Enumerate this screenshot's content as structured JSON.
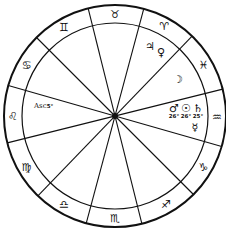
{
  "chart": {
    "center": [
      115,
      116
    ],
    "outer_radius": 111,
    "inner_radius": 93,
    "cusp_angles_deg": [
      256,
      285,
      314,
      346,
      16,
      45
    ],
    "signs": [
      {
        "name": "Taurus",
        "glyph": "♉",
        "angle": 270
      },
      {
        "name": "Aries",
        "glyph": "♈",
        "angle": 299
      },
      {
        "name": "Pisces",
        "glyph": "♓",
        "angle": 330
      },
      {
        "name": "Aquarius",
        "glyph": "♒",
        "angle": 1
      },
      {
        "name": "Capricorn",
        "glyph": "♑",
        "angle": 30
      },
      {
        "name": "Sagittarius",
        "glyph": "♐",
        "angle": 60
      },
      {
        "name": "Scorpio",
        "glyph": "♏",
        "angle": 90
      },
      {
        "name": "Libra",
        "glyph": "♎",
        "angle": 120
      },
      {
        "name": "Virgo",
        "glyph": "♍",
        "angle": 150
      },
      {
        "name": "Leo",
        "glyph": "♌",
        "angle": 180
      },
      {
        "name": "Cancer",
        "glyph": "♋",
        "angle": 210
      },
      {
        "name": "Gemini",
        "glyph": "♊",
        "angle": 240
      }
    ],
    "planets": [
      {
        "name": "Jupiter",
        "glyph": "♃",
        "x": 150,
        "y": 46
      },
      {
        "name": "Venus",
        "glyph": "♀",
        "x": 161,
        "y": 52
      },
      {
        "name": "Moon",
        "glyph": "☽",
        "x": 178,
        "y": 79
      },
      {
        "name": "Mars",
        "glyph": "♂",
        "x": 174,
        "y": 108,
        "degree": "26°"
      },
      {
        "name": "Sun",
        "glyph": "☉",
        "x": 186,
        "y": 108,
        "degree": "26°"
      },
      {
        "name": "Saturn",
        "glyph": "♄",
        "x": 198,
        "y": 108,
        "degree": "25°"
      },
      {
        "name": "Mercury",
        "glyph": "☿",
        "x": 195,
        "y": 127
      }
    ],
    "ascendant": {
      "label": "Asc",
      "degree": "5°",
      "x": 34,
      "y": 106
    }
  }
}
